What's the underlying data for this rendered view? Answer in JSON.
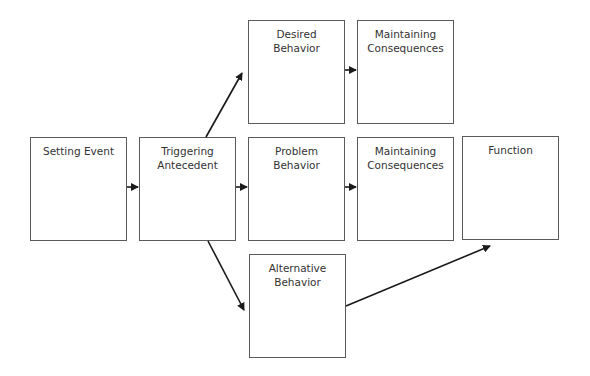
{
  "diagram": {
    "type": "flowchart",
    "nodes": {
      "setting_event": {
        "label": "Setting Event"
      },
      "triggering_antecedent": {
        "label": "Triggering\nAntecedent"
      },
      "desired_behavior": {
        "label": "Desired\nBehavior"
      },
      "maintaining_consequences_desired": {
        "label": "Maintaining\nConsequences"
      },
      "problem_behavior": {
        "label": "Problem\nBehavior"
      },
      "maintaining_consequences_problem": {
        "label": "Maintaining\nConsequences"
      },
      "function": {
        "label": "Function"
      },
      "alternative_behavior": {
        "label": "Alternative\nBehavior"
      }
    },
    "edges": [
      {
        "from": "setting_event",
        "to": "triggering_antecedent"
      },
      {
        "from": "triggering_antecedent",
        "to": "desired_behavior"
      },
      {
        "from": "triggering_antecedent",
        "to": "problem_behavior"
      },
      {
        "from": "triggering_antecedent",
        "to": "alternative_behavior"
      },
      {
        "from": "desired_behavior",
        "to": "maintaining_consequences_desired"
      },
      {
        "from": "problem_behavior",
        "to": "maintaining_consequences_problem"
      },
      {
        "from": "alternative_behavior",
        "to": "function"
      }
    ],
    "colors": {
      "stroke": "#5a5a5a",
      "arrow": "#1a1a1a",
      "text": "#333333"
    }
  }
}
